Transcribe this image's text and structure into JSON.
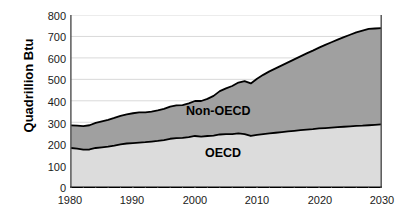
{
  "chart_data": {
    "type": "area",
    "stacked": true,
    "title": "",
    "subtitle": "",
    "xlabel": "",
    "ylabel": "Quadrillion Btu",
    "xlim": [
      1980,
      2030
    ],
    "ylim": [
      0,
      800
    ],
    "ytick_labels": [
      "0",
      "100",
      "200",
      "300",
      "400",
      "500",
      "600",
      "700",
      "800"
    ],
    "ytick_values": [
      0,
      100,
      200,
      300,
      400,
      500,
      600,
      700,
      800
    ],
    "xtick_labels": [
      "1980",
      "1990",
      "2000",
      "2010",
      "2020",
      "2030"
    ],
    "xtick_values": [
      1980,
      1990,
      2000,
      2010,
      2020,
      2030
    ],
    "grid": "horizontal",
    "legend_position": "inline-annotations",
    "x": [
      1980,
      1981,
      1982,
      1983,
      1984,
      1985,
      1986,
      1987,
      1988,
      1989,
      1990,
      1991,
      1992,
      1993,
      1994,
      1995,
      1996,
      1997,
      1998,
      1999,
      2000,
      2001,
      2002,
      2003,
      2004,
      2005,
      2006,
      2007,
      2008,
      2009,
      2010,
      2011,
      2012,
      2013,
      2014,
      2015,
      2016,
      2017,
      2018,
      2019,
      2020,
      2021,
      2022,
      2023,
      2024,
      2025,
      2026,
      2027,
      2028,
      2029,
      2030
    ],
    "series": [
      {
        "name": "OECD",
        "color": "#dcdcdc",
        "values": [
          180,
          177,
          172,
          173,
          180,
          183,
          186,
          191,
          197,
          201,
          203,
          205,
          207,
          210,
          213,
          217,
          223,
          226,
          227,
          231,
          236,
          233,
          236,
          238,
          243,
          245,
          245,
          248,
          245,
          236,
          241,
          245,
          248,
          251,
          254,
          257,
          260,
          263,
          266,
          268,
          271,
          273,
          275,
          277,
          279,
          281,
          283,
          284,
          286,
          288,
          290
        ]
      },
      {
        "name": "Non-OECD",
        "color": "#a0a0a0",
        "values": [
          105,
          107,
          110,
          113,
          117,
          121,
          125,
          129,
          133,
          136,
          139,
          141,
          139,
          140,
          142,
          145,
          150,
          153,
          153,
          157,
          163,
          166,
          173,
          185,
          202,
          213,
          224,
          237,
          247,
          245,
          262,
          276,
          289,
          300,
          311,
          322,
          333,
          344,
          355,
          366,
          377,
          388,
          398,
          408,
          418,
          427,
          436,
          443,
          449,
          449,
          449
        ]
      }
    ],
    "totals": [
      285,
      284,
      282,
      286,
      297,
      304,
      311,
      320,
      330,
      337,
      342,
      346,
      346,
      350,
      355,
      362,
      373,
      379,
      380,
      388,
      399,
      399,
      409,
      423,
      445,
      458,
      469,
      485,
      492,
      481,
      503,
      521,
      537,
      551,
      565,
      579,
      593,
      607,
      621,
      634,
      648,
      661,
      673,
      685,
      697,
      708,
      719,
      727,
      735,
      737,
      739
    ]
  },
  "annotations": {
    "non_oecd_label": "Non-OECD",
    "oecd_label": "OECD"
  }
}
